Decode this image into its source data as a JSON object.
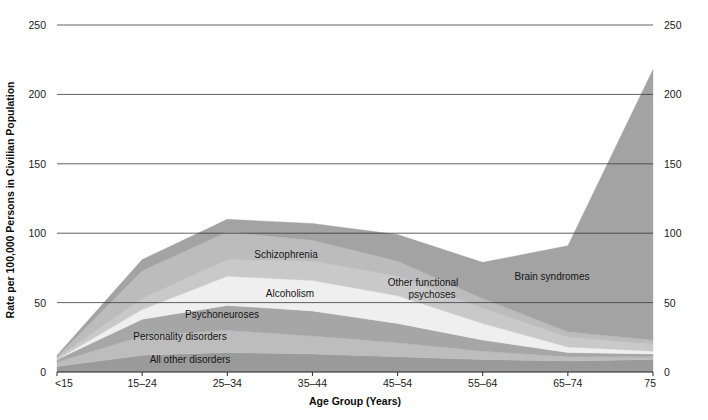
{
  "chart_data": {
    "type": "area",
    "stacked": true,
    "title": "",
    "xlabel": "Age Group (Years)",
    "ylabel": "Rate per 100,000 Persons in Civilian Population",
    "categories": [
      "<15",
      "15–24",
      "25–34",
      "35–44",
      "45–54",
      "55–64",
      "65–74",
      "75"
    ],
    "xtick_labels": [
      "<15",
      "15–24",
      "25–34",
      "35–44",
      "45–54",
      "55–64",
      "65–74",
      "75"
    ],
    "ytick_labels_left": [
      "0",
      "50",
      "100",
      "150",
      "200",
      "250"
    ],
    "ytick_labels_right": [
      "0",
      "50",
      "100",
      "150",
      "200",
      "250"
    ],
    "ytick_values": [
      0,
      50,
      100,
      150,
      200,
      250
    ],
    "ylim": [
      0,
      250
    ],
    "grid": true,
    "legend_position": "inline-annotations",
    "series": [
      {
        "name": "All other disorders",
        "color": "#9a9a9a",
        "values": [
          4,
          12,
          14,
          13,
          11,
          9,
          8,
          9
        ]
      },
      {
        "name": "Personality disorders",
        "color": "#bdbdbd",
        "values": [
          3,
          14,
          16,
          13,
          10,
          6,
          3,
          2
        ]
      },
      {
        "name": "Psychoneuroses",
        "color": "#a6a6a6",
        "values": [
          2,
          12,
          18,
          18,
          14,
          8,
          3,
          2
        ]
      },
      {
        "name": "Alcoholism",
        "color": "#efefef",
        "values": [
          0,
          7,
          21,
          22,
          20,
          12,
          4,
          2
        ]
      },
      {
        "name": "Other functional psychoses",
        "color": "#c9c9c9",
        "values": [
          1,
          8,
          12,
          14,
          14,
          11,
          7,
          5
        ]
      },
      {
        "name": "Schizophrenia",
        "color": "#bcbcbc",
        "values": [
          1,
          20,
          20,
          15,
          11,
          7,
          4,
          3
        ]
      },
      {
        "name": "Brain syndromes",
        "color": "#a3a3a3",
        "values": [
          1,
          8,
          9,
          12,
          19,
          26,
          62,
          195
        ]
      }
    ],
    "annotations": [
      {
        "name": "schizophrenia",
        "text": "Schizophrenia",
        "x": 286,
        "y": 258
      },
      {
        "name": "alcoholism",
        "text": "Alcoholism",
        "x": 290,
        "y": 297
      },
      {
        "name": "other-functional-psychoses-line1",
        "text": "Other functional",
        "x": 423,
        "y": 286
      },
      {
        "name": "other-functional-psychoses-line2",
        "text": "psychoses",
        "x": 432,
        "y": 298
      },
      {
        "name": "brain-syndromes",
        "text": "Brain syndromes",
        "x": 552,
        "y": 280
      },
      {
        "name": "psychoneuroses",
        "text": "Psychoneuroses",
        "x": 222,
        "y": 318
      },
      {
        "name": "personality-disorders",
        "text": "Personality disorders",
        "x": 180,
        "y": 340
      },
      {
        "name": "all-other-disorders",
        "text": "All other disorders",
        "x": 190,
        "y": 363
      }
    ]
  }
}
